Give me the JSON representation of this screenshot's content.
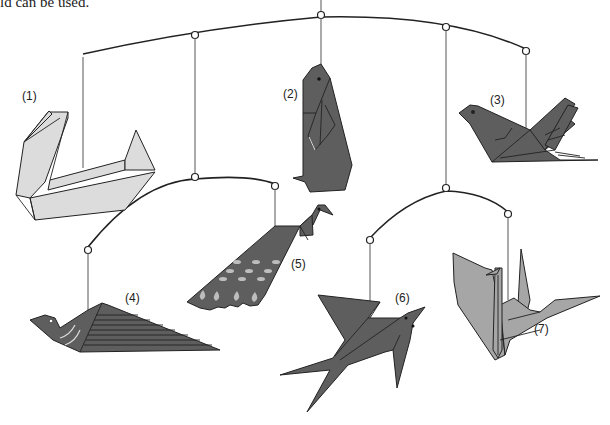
{
  "caption": {
    "text": "ld can be used."
  },
  "mobile": {
    "description": "Origami bird mobile with seven hanging figures",
    "colors": {
      "light_paper": "#dcdcdc",
      "medium_paper": "#a6a6a6",
      "dark_paper": "#5e5e5e",
      "line": "#222222"
    },
    "figures": [
      {
        "number": 1,
        "label": "(1)",
        "name": "swan",
        "shade": "light"
      },
      {
        "number": 2,
        "label": "(2)",
        "name": "penguin",
        "shade": "dark"
      },
      {
        "number": 3,
        "label": "(3)",
        "name": "pigeon",
        "shade": "dark"
      },
      {
        "number": 4,
        "label": "(4)",
        "name": "duck",
        "shade": "dark"
      },
      {
        "number": 5,
        "label": "(5)",
        "name": "peacock",
        "shade": "dark"
      },
      {
        "number": 6,
        "label": "(6)",
        "name": "swallow",
        "shade": "dark"
      },
      {
        "number": 7,
        "label": "(7)",
        "name": "crane",
        "shade": "medium"
      }
    ]
  }
}
